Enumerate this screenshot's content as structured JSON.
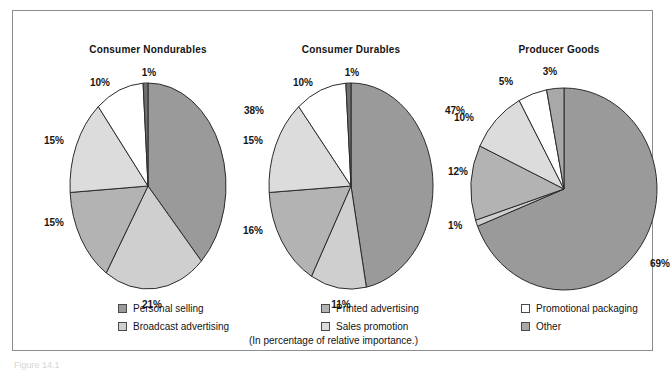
{
  "figure": {
    "caption": "(In percentage of relative importance.)",
    "figure_number": "Figure 14.1"
  },
  "legend": {
    "columns": [
      {
        "items": [
          {
            "label": "Personal selling",
            "color": "#9a9a9a"
          },
          {
            "label": "Broadcast advertising",
            "color": "#cfcfcf"
          }
        ]
      },
      {
        "items": [
          {
            "label": "Printed advertising",
            "color": "#b3b3b3"
          },
          {
            "label": "Sales promotion",
            "color": "#dcdcdc"
          }
        ]
      },
      {
        "items": [
          {
            "label": "Promotional packaging",
            "color": "#ffffff"
          },
          {
            "label": "Other",
            "color": "#a8a8a8"
          }
        ]
      }
    ]
  },
  "chart_data": [
    {
      "type": "pie",
      "title": "Consumer Nondurables",
      "categories": [
        "Personal selling",
        "Broadcast advertising",
        "Printed advertising",
        "Sales promotion",
        "Promotional packaging",
        "Other"
      ],
      "values": [
        38,
        21,
        15,
        15,
        10,
        1
      ],
      "labels": [
        "38%",
        "21%",
        "15%",
        "15%",
        "10%",
        "1%"
      ],
      "colors": [
        "#9a9a9a",
        "#cfcfcf",
        "#b3b3b3",
        "#dcdcdc",
        "#ffffff",
        "#6f6f6f"
      ],
      "start_angle": 0,
      "direction": "clockwise",
      "unit": "percent"
    },
    {
      "type": "pie",
      "title": "Consumer Durables",
      "categories": [
        "Personal selling",
        "Broadcast advertising",
        "Printed advertising",
        "Sales promotion",
        "Promotional packaging",
        "Other"
      ],
      "values": [
        47,
        11,
        16,
        15,
        10,
        1
      ],
      "labels": [
        "47%",
        "11%",
        "16%",
        "15%",
        "10%",
        "1%"
      ],
      "colors": [
        "#9a9a9a",
        "#cfcfcf",
        "#b3b3b3",
        "#dcdcdc",
        "#ffffff",
        "#6f6f6f"
      ],
      "start_angle": 0,
      "direction": "clockwise",
      "unit": "percent"
    },
    {
      "type": "pie",
      "title": "Producer Goods",
      "categories": [
        "Personal selling",
        "Broadcast advertising",
        "Printed advertising",
        "Sales promotion",
        "Promotional packaging",
        "Other"
      ],
      "values": [
        69,
        1,
        12,
        10,
        5,
        3
      ],
      "labels": [
        "69%",
        "1%",
        "12%",
        "10%",
        "5%",
        "3%"
      ],
      "colors": [
        "#9a9a9a",
        "#cfcfcf",
        "#b3b3b3",
        "#dcdcdc",
        "#ffffff",
        "#a8a8a8"
      ],
      "start_angle": 0,
      "direction": "clockwise",
      "unit": "percent"
    }
  ],
  "geometry": {
    "pies": [
      {
        "cx": 135,
        "cy": 175,
        "rx": 78,
        "ry": 103,
        "title_x": 135,
        "title_y": 33
      },
      {
        "cx": 338,
        "cy": 175,
        "rx": 82,
        "ry": 103,
        "title_x": 338,
        "title_y": 33
      },
      {
        "cx": 551,
        "cy": 178,
        "rx": 93,
        "ry": 101,
        "title_x": 546,
        "title_y": 33
      }
    ],
    "label_offsets": [
      [
        {
          "dx": 96,
          "dy": -72,
          "anchor": "start"
        },
        {
          "dx": 4,
          "dy": 122,
          "anchor": "middle"
        },
        {
          "dx": -104,
          "dy": 40,
          "anchor": "start"
        },
        {
          "dx": -104,
          "dy": -42,
          "anchor": "start"
        },
        {
          "dx": -48,
          "dy": -100,
          "anchor": "middle"
        },
        {
          "dx": 1,
          "dy": -110,
          "anchor": "middle"
        }
      ],
      [
        {
          "dx": 94,
          "dy": -72,
          "anchor": "start"
        },
        {
          "dx": -10,
          "dy": 122,
          "anchor": "middle"
        },
        {
          "dx": -108,
          "dy": 48,
          "anchor": "start"
        },
        {
          "dx": -108,
          "dy": -42,
          "anchor": "start"
        },
        {
          "dx": -48,
          "dy": -100,
          "anchor": "middle"
        },
        {
          "dx": 1,
          "dy": -110,
          "anchor": "middle"
        }
      ],
      [
        {
          "dx": 86,
          "dy": 78,
          "anchor": "start"
        },
        {
          "dx": -116,
          "dy": 40,
          "anchor": "start"
        },
        {
          "dx": -116,
          "dy": -14,
          "anchor": "start"
        },
        {
          "dx": -110,
          "dy": -68,
          "anchor": "start"
        },
        {
          "dx": -58,
          "dy": -104,
          "anchor": "middle"
        },
        {
          "dx": -14,
          "dy": -114,
          "anchor": "middle"
        }
      ]
    ],
    "legend_columns_x": [
      105,
      308,
      508
    ]
  }
}
